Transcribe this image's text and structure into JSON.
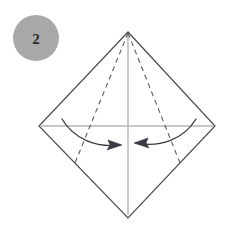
{
  "figure": {
    "kind": "origami-fold-diagram",
    "width": 235,
    "height": 226,
    "background_color": "#ffffff"
  },
  "step_badge": {
    "label": "2",
    "circle_color": "#a8a8a8",
    "text_color": "#2b2b2b",
    "center_x": 36,
    "center_y": 38,
    "radius": 23
  },
  "colors": {
    "edge_stroke": "#4a4a52",
    "crease_guide": "#b4b4b4",
    "dashed_fold": "#5a5a62",
    "arrow": "#3a3a42"
  },
  "paper": {
    "shape_name": "square-rotated-45",
    "vertices": {
      "top": {
        "x": 128,
        "y": 32
      },
      "left": {
        "x": 39,
        "y": 126
      },
      "right": {
        "x": 215,
        "y": 126
      },
      "bottom": {
        "x": 128,
        "y": 218
      }
    },
    "outline_path": "M128,32 L39,126 L128,218 L215,126 Z",
    "stroke_width": 1.2
  },
  "guide_lines": [
    {
      "name": "vertical-center-crease",
      "x1": 128,
      "y1": 33,
      "x2": 128,
      "y2": 214,
      "stroke_width": 1.4
    },
    {
      "name": "horizontal-center-crease",
      "x1": 41,
      "y1": 126,
      "x2": 213,
      "y2": 126,
      "stroke_width": 1.4
    }
  ],
  "fold_lines": [
    {
      "name": "left-dashed-fold",
      "x1": 128,
      "y1": 33,
      "x2": 75,
      "y2": 163,
      "dash": "5,4",
      "stroke_width": 1.1
    },
    {
      "name": "right-dashed-fold",
      "x1": 128,
      "y1": 33,
      "x2": 180,
      "y2": 163,
      "dash": "5,4",
      "stroke_width": 1.1
    }
  ],
  "arrows": [
    {
      "name": "left-fold-arrow",
      "direction": "right",
      "path": "M62,119 C74,139 96,148 120,145",
      "head_path": "M122,145 L108,140 L110,145 L107,150 Z",
      "stroke_width": 1.3
    },
    {
      "name": "right-fold-arrow",
      "direction": "left",
      "path": "M196,119 C184,139 160,148 136,143",
      "head_path": "M134,143 L148,138 L146,143 L149,148 Z",
      "stroke_width": 1.3
    }
  ]
}
